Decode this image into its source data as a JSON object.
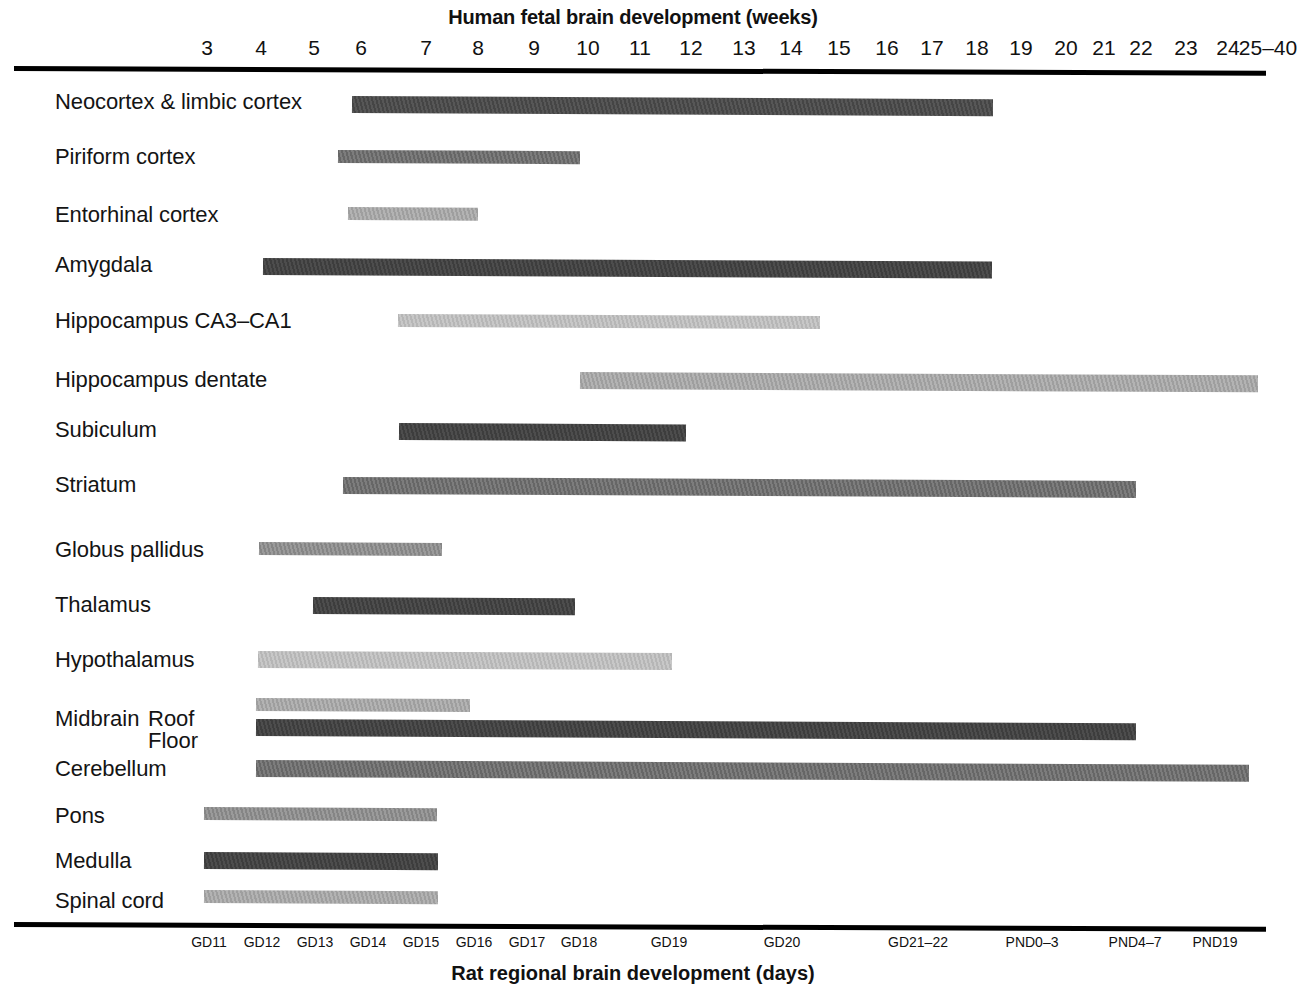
{
  "figure": {
    "top_axis_title": "Human fetal brain development (weeks)",
    "bottom_axis_title": "Rat regional brain development (days)"
  },
  "chart_data": {
    "type": "bar",
    "orientation": "horizontal-range",
    "title": "Human fetal brain development (weeks)",
    "subtitle": "Rat regional brain development (days)",
    "xlabel": "Human fetal brain development (weeks)",
    "xlabel_secondary": "Rat regional brain development (days)",
    "ylabel": "",
    "grid": false,
    "legend": "none",
    "top_axis": {
      "label": "Human fetal brain development (weeks)",
      "ticks": [
        {
          "text": "3",
          "x": 207
        },
        {
          "text": "4",
          "x": 261
        },
        {
          "text": "5",
          "x": 314
        },
        {
          "text": "6",
          "x": 361
        },
        {
          "text": "7",
          "x": 426
        },
        {
          "text": "8",
          "x": 478
        },
        {
          "text": "9",
          "x": 534
        },
        {
          "text": "10",
          "x": 588
        },
        {
          "text": "11",
          "x": 640
        },
        {
          "text": "12",
          "x": 691
        },
        {
          "text": "13",
          "x": 744
        },
        {
          "text": "14",
          "x": 791
        },
        {
          "text": "15",
          "x": 839
        },
        {
          "text": "16",
          "x": 887
        },
        {
          "text": "17",
          "x": 932
        },
        {
          "text": "18",
          "x": 977
        },
        {
          "text": "19",
          "x": 1021
        },
        {
          "text": "20",
          "x": 1066
        },
        {
          "text": "21",
          "x": 1104
        },
        {
          "text": "22",
          "x": 1141
        },
        {
          "text": "23",
          "x": 1186
        },
        {
          "text": "24",
          "x": 1228
        },
        {
          "text": "25–40",
          "x": 1268
        }
      ]
    },
    "bottom_axis": {
      "label": "Rat regional brain development (days)",
      "ticks": [
        {
          "text": "GD11",
          "x": 209
        },
        {
          "text": "GD12",
          "x": 262
        },
        {
          "text": "GD13",
          "x": 315
        },
        {
          "text": "GD14",
          "x": 368
        },
        {
          "text": "GD15",
          "x": 421
        },
        {
          "text": "GD16",
          "x": 474
        },
        {
          "text": "GD17",
          "x": 527
        },
        {
          "text": "GD18",
          "x": 579
        },
        {
          "text": "GD19",
          "x": 669
        },
        {
          "text": "GD20",
          "x": 782
        },
        {
          "text": "GD21–22",
          "x": 918
        },
        {
          "text": "PND0–3",
          "x": 1032
        },
        {
          "text": "PND4–7",
          "x": 1135
        },
        {
          "text": "PND19",
          "x": 1215
        }
      ]
    },
    "rows": [
      {
        "label": "Neocortex & limbic cortex",
        "sublabel": null,
        "label_y": 89,
        "bar_y": 96,
        "x_start": 352,
        "x_end": 993,
        "week_start": 5.8,
        "week_end": 19.0,
        "tone": "tone-dark",
        "thickness": "thick"
      },
      {
        "label": "Piriform cortex",
        "sublabel": null,
        "label_y": 144,
        "bar_y": 150,
        "x_start": 338,
        "x_end": 580,
        "week_start": 5.5,
        "week_end": 10.0,
        "tone": "tone-mid",
        "thickness": "thin"
      },
      {
        "label": "Entorhinal cortex",
        "sublabel": null,
        "label_y": 202,
        "bar_y": 207,
        "x_start": 348,
        "x_end": 478,
        "week_start": 5.7,
        "week_end": 8.0,
        "tone": "tone-light",
        "thickness": "thin"
      },
      {
        "label": "Amygdala",
        "sublabel": null,
        "label_y": 252,
        "bar_y": 258,
        "x_start": 263,
        "x_end": 992,
        "week_start": 4.0,
        "week_end": 19.0,
        "tone": "tone-darker",
        "thickness": "thick"
      },
      {
        "label": "Hippocampus CA3–CA1",
        "sublabel": null,
        "label_y": 308,
        "bar_y": 314,
        "x_start": 398,
        "x_end": 820,
        "week_start": 6.7,
        "week_end": 15.0,
        "tone": "tone-lighter",
        "thickness": "thin"
      },
      {
        "label": "Hippocampus dentate",
        "sublabel": null,
        "label_y": 367,
        "bar_y": 372,
        "x_start": 580,
        "x_end": 1258,
        "week_start": 10.0,
        "week_end": 40.0,
        "tone": "tone-light",
        "thickness": "thick"
      },
      {
        "label": "Subiculum",
        "sublabel": null,
        "label_y": 417,
        "bar_y": 423,
        "x_start": 399,
        "x_end": 686,
        "week_start": 6.7,
        "week_end": 12.0,
        "tone": "tone-darker",
        "thickness": "thick"
      },
      {
        "label": "Striatum",
        "sublabel": null,
        "label_y": 472,
        "bar_y": 477,
        "x_start": 343,
        "x_end": 1136,
        "week_start": 5.6,
        "week_end": 23.0,
        "tone": "tone-mid",
        "thickness": "thick"
      },
      {
        "label": "Globus pallidus",
        "sublabel": null,
        "label_y": 537,
        "bar_y": 542,
        "x_start": 259,
        "x_end": 442,
        "week_start": 4.0,
        "week_end": 7.4,
        "tone": "tone-midlight",
        "thickness": "thin"
      },
      {
        "label": "Thalamus",
        "sublabel": null,
        "label_y": 592,
        "bar_y": 597,
        "x_start": 313,
        "x_end": 575,
        "week_start": 5.0,
        "week_end": 10.0,
        "tone": "tone-darker",
        "thickness": "thick"
      },
      {
        "label": "Hypothalamus",
        "sublabel": null,
        "label_y": 647,
        "bar_y": 651,
        "x_start": 258,
        "x_end": 672,
        "week_start": 4.0,
        "week_end": 11.6,
        "tone": "tone-lighter",
        "thickness": "thick"
      },
      {
        "label": "Midbrain",
        "sublabel": "Roof",
        "label_y": 706,
        "bar_y": 698,
        "x_start": 256,
        "x_end": 470,
        "week_start": 4.0,
        "week_end": 7.9,
        "tone": "tone-light",
        "thickness": "thin"
      },
      {
        "label": null,
        "sublabel": "Floor",
        "label_y": 728,
        "bar_y": 719,
        "x_start": 256,
        "x_end": 1136,
        "week_start": 4.0,
        "week_end": 23.0,
        "tone": "tone-darker",
        "thickness": "thick"
      },
      {
        "label": "Cerebellum",
        "sublabel": null,
        "label_y": 756,
        "bar_y": 760,
        "x_start": 256,
        "x_end": 1249,
        "week_start": 4.0,
        "week_end": 25.0,
        "tone": "tone-mid",
        "thickness": "thick"
      },
      {
        "label": "Pons",
        "sublabel": null,
        "label_y": 803,
        "bar_y": 807,
        "x_start": 204,
        "x_end": 437,
        "week_start": 3.0,
        "week_end": 7.4,
        "tone": "tone-midlight",
        "thickness": "thin"
      },
      {
        "label": "Medulla",
        "sublabel": null,
        "label_y": 848,
        "bar_y": 852,
        "x_start": 204,
        "x_end": 438,
        "week_start": 3.0,
        "week_end": 7.4,
        "tone": "tone-darker",
        "thickness": "thick"
      },
      {
        "label": "Spinal cord",
        "sublabel": null,
        "label_y": 888,
        "bar_y": 890,
        "x_start": 204,
        "x_end": 438,
        "week_start": 3.0,
        "week_end": 7.4,
        "tone": "tone-light",
        "thickness": "thin"
      }
    ]
  }
}
